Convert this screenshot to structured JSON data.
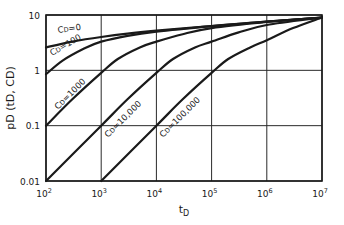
{
  "chart_data": {
    "type": "line",
    "title": "",
    "xlabel": "t_D",
    "ylabel": "p_D (t_D, C_D)",
    "xscale": "log",
    "yscale": "log",
    "xlim": [
      100,
      10000000
    ],
    "ylim": [
      0.01,
      10
    ],
    "grid": true,
    "legend": "inline curve labels",
    "x_ticks": [
      {
        "value": 100,
        "label_base": "10",
        "label_exp": "2"
      },
      {
        "value": 1000,
        "label_base": "10",
        "label_exp": "3"
      },
      {
        "value": 10000,
        "label_base": "10",
        "label_exp": "4"
      },
      {
        "value": 100000,
        "label_base": "10",
        "label_exp": "5"
      },
      {
        "value": 1000000,
        "label_base": "10",
        "label_exp": "6"
      },
      {
        "value": 10000000,
        "label_base": "10",
        "label_exp": "7"
      }
    ],
    "y_ticks": [
      {
        "value": 0.01,
        "label": "0.01"
      },
      {
        "value": 0.1,
        "label": "0.1"
      },
      {
        "value": 1,
        "label": "1"
      },
      {
        "value": 10,
        "label": "10"
      }
    ],
    "series": [
      {
        "name": "CD=0",
        "label": "CD=0",
        "x": [
          100,
          300,
          1000,
          3000,
          10000,
          100000,
          1000000,
          10000000
        ],
        "y": [
          2.6,
          3.3,
          4.0,
          4.6,
          5.2,
          6.3,
          7.6,
          9.0
        ],
        "label_pos": {
          "x": 58,
          "y": 33,
          "angle": -8
        }
      },
      {
        "name": "CD=100",
        "label": "CD=100",
        "x": [
          100,
          200,
          500,
          1000,
          3000,
          10000,
          100000,
          1000000,
          10000000
        ],
        "y": [
          0.85,
          1.5,
          2.5,
          3.3,
          4.2,
          5.0,
          6.3,
          7.6,
          9.0
        ],
        "label_pos": {
          "x": 52,
          "y": 56,
          "angle": -30
        }
      },
      {
        "name": "CD=1000",
        "label": "CD=1000",
        "x": [
          100,
          300,
          1000,
          2000,
          5000,
          10000,
          30000,
          100000,
          1000000,
          10000000
        ],
        "y": [
          0.1,
          0.3,
          0.9,
          1.6,
          2.6,
          3.3,
          4.5,
          5.8,
          7.5,
          9.0
        ],
        "label_pos": {
          "x": 58,
          "y": 110,
          "angle": -45
        }
      },
      {
        "name": "CD=10,000",
        "label": "CD=10,000",
        "x": [
          100,
          1000,
          3000,
          10000,
          20000,
          50000,
          100000,
          300000,
          1000000,
          10000000
        ],
        "y": [
          0.01,
          0.1,
          0.3,
          0.9,
          1.6,
          2.6,
          3.3,
          4.8,
          6.6,
          9.0
        ],
        "label_pos": {
          "x": 108,
          "y": 138,
          "angle": -45
        }
      },
      {
        "name": "CD=100,000",
        "label": "CD=100,000",
        "x": [
          1000,
          10000,
          30000,
          100000,
          200000,
          500000,
          1000000,
          3000000,
          10000000
        ],
        "y": [
          0.01,
          0.1,
          0.3,
          0.9,
          1.6,
          2.6,
          3.5,
          5.8,
          9.0
        ],
        "label_pos": {
          "x": 163,
          "y": 138,
          "angle": -45
        }
      }
    ]
  },
  "colors": {
    "line": "#1a1a1a",
    "grid": "#2a2a2a",
    "background": "#ffffff"
  }
}
